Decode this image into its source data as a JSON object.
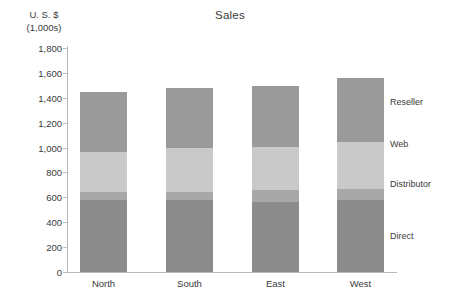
{
  "chart_data": {
    "type": "bar",
    "subtype": "stacked-column",
    "title": "Sales",
    "ylabel": "U. S. $ (1,000s)",
    "ylabel_line1": "U. S. $",
    "ylabel_line2": "(1,000s)",
    "xlabel": "",
    "categories": [
      "North",
      "South",
      "East",
      "West"
    ],
    "ylim": [
      0,
      1800
    ],
    "y_ticks": [
      0,
      200,
      400,
      600,
      800,
      1000,
      1200,
      1400,
      1600,
      1800
    ],
    "y_tick_labels": [
      "0",
      "200",
      "400",
      "600",
      "800",
      "1,000",
      "1,200",
      "1,400",
      "1,600",
      "1,800"
    ],
    "grid": false,
    "legend_position": "right",
    "stack_order_bottom_to_top": [
      "Direct",
      "Distributor",
      "Web",
      "Reseller"
    ],
    "series": [
      {
        "name": "Direct",
        "color": "#8c8c8c",
        "values": [
          575,
          575,
          560,
          575
        ],
        "label_y_value": 290
      },
      {
        "name": "Distributor",
        "color": "#a8a8a8",
        "values": [
          70,
          70,
          100,
          95
        ],
        "label_y_value": 710
      },
      {
        "name": "Web",
        "color": "#c9c9c9",
        "values": [
          320,
          355,
          345,
          375
        ],
        "label_y_value": 1030
      },
      {
        "name": "Reseller",
        "color": "#9a9a9a",
        "values": [
          485,
          480,
          490,
          515
        ],
        "label_y_value": 1370
      }
    ],
    "totals": [
      1450,
      1480,
      1495,
      1560
    ]
  },
  "legend": {
    "items": [
      {
        "label": "Reseller"
      },
      {
        "label": "Web"
      },
      {
        "label": "Distributor"
      },
      {
        "label": "Direct"
      }
    ]
  },
  "axis": {
    "line_color": "#b9b9b9",
    "text_color": "#3a3a3a"
  }
}
